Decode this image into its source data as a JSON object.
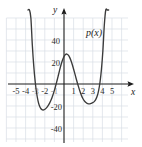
{
  "chart_data": {
    "type": "line",
    "title": "",
    "subtitle": "",
    "xlabel": "x",
    "ylabel": "y",
    "curve_label": "p(x)",
    "xlim": [
      -5.8,
      5.8
    ],
    "ylim": [
      -52,
      58
    ],
    "grid": true,
    "grid_spacing_x": 1,
    "grid_spacing_y": 10,
    "legend_position": "none",
    "x_tick_labels": [
      "-5",
      "-4",
      "-3",
      "-2",
      "-1",
      "1",
      "2",
      "3",
      "4",
      "5"
    ],
    "x_tick_values": [
      -5,
      -4,
      -3,
      -2,
      -1,
      1,
      2,
      3,
      4,
      5
    ],
    "x_ticks_visible": [
      "-5",
      "-4",
      "-2",
      "1",
      "2",
      "3",
      "4",
      "5"
    ],
    "y_tick_labels": [
      "40",
      "20",
      "-20",
      "-40"
    ],
    "y_tick_values": [
      40,
      20,
      -20,
      -40
    ],
    "roots": [
      -3,
      -1,
      2,
      4
    ],
    "local_minima": [
      {
        "x": -2.1,
        "y": -27
      },
      {
        "x": 3.1,
        "y": -27
      }
    ],
    "local_maxima": [
      {
        "x": 0.55,
        "y": 25
      }
    ],
    "series": [
      {
        "name": "p(x)",
        "color": "#3b3b3b",
        "x": [
          -3.75,
          -3.6,
          -3.45,
          -3.3,
          -3.15,
          -3.0,
          -2.85,
          -2.7,
          -2.55,
          -2.4,
          -2.25,
          -2.1,
          -1.95,
          -1.8,
          -1.65,
          -1.5,
          -1.35,
          -1.2,
          -1.05,
          -0.9,
          -0.75,
          -0.6,
          -0.45,
          -0.3,
          -0.15,
          0.0,
          0.15,
          0.3,
          0.45,
          0.6,
          0.75,
          0.9,
          1.05,
          1.2,
          1.35,
          1.5,
          1.65,
          1.8,
          1.95,
          2.1,
          2.25,
          2.4,
          2.55,
          2.7,
          2.85,
          3.0,
          3.15,
          3.3,
          3.45,
          3.6,
          3.75,
          3.9,
          4.05,
          4.2,
          4.35,
          4.5,
          4.65
        ],
        "y": [
          129.2,
          91.0,
          60.0,
          35.4,
          16.3,
          2.0,
          -8.4,
          -15.5,
          -20.0,
          -22.5,
          -23.5,
          -23.5,
          -22.8,
          -21.5,
          -19.7,
          -17.4,
          -14.6,
          -11.2,
          -7.2,
          -2.7,
          2.3,
          7.5,
          12.8,
          17.7,
          21.8,
          25.0,
          26.8,
          27.2,
          26.2,
          24.0,
          20.7,
          16.6,
          11.9,
          7.1,
          2.3,
          -2.2,
          -6.4,
          -10.0,
          -13.0,
          -15.2,
          -16.7,
          -17.6,
          -18.0,
          -18.0,
          -17.6,
          -17.0,
          -16.0,
          -14.2,
          -11.2,
          -6.2,
          1.6,
          13.3,
          30.1,
          53.6,
          85.3,
          127.0,
          180.9
        ]
      }
    ]
  },
  "figure": {
    "background_color": "#ffffff",
    "grid_color": "#d8dde4",
    "axis_color": "#1c1c1c",
    "curve_color": "#3b3b3b",
    "text_color": "#2b2b2b"
  }
}
